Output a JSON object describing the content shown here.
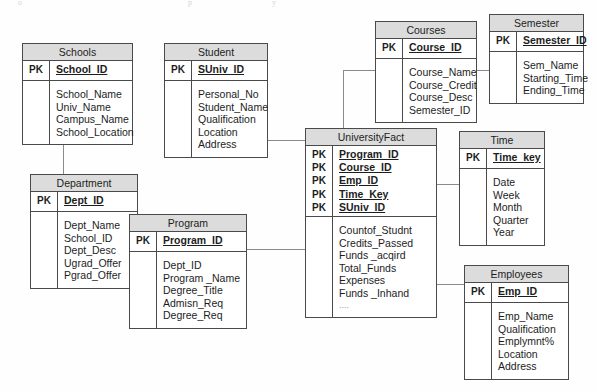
{
  "diagram": {
    "pk_label": "PK",
    "ellipsis": "....",
    "colors": {
      "header_fill": "#dcdcdc",
      "border": "#4a4a4a",
      "connector": "#8a8a8a",
      "text": "#1d1d1d",
      "background": "#fefefe"
    },
    "entities": [
      {
        "id": "schools",
        "name": "Schools",
        "keys": [
          "School_ID"
        ],
        "attributes": [
          "School_Name",
          "Univ_Name",
          "Campus_Name",
          "School_Location"
        ]
      },
      {
        "id": "student",
        "name": "Student",
        "keys": [
          "SUniv_ID"
        ],
        "attributes": [
          "Personal_No",
          "Student_Name",
          "Qualification",
          "Location",
          "Address"
        ]
      },
      {
        "id": "courses",
        "name": "Courses",
        "keys": [
          "Course_ID"
        ],
        "attributes": [
          "Course_Name",
          "Course_Credit",
          "Course_Desc",
          "Semester_ID"
        ]
      },
      {
        "id": "semester",
        "name": "Semester",
        "keys": [
          "Semester_ID"
        ],
        "attributes": [
          "Sem_Name",
          "Starting_Time",
          "Ending_Time"
        ]
      },
      {
        "id": "department",
        "name": "Department",
        "keys": [
          "Dept_ID"
        ],
        "attributes": [
          "Dept_Name",
          "School_ID",
          "Dept_Desc",
          "Ugrad_Offer",
          "Pgrad_Offer"
        ]
      },
      {
        "id": "program",
        "name": "Program",
        "keys": [
          "Program_ID"
        ],
        "attributes": [
          "Dept_ID",
          "Program _Name",
          "Degree_Title",
          "Admisn_Req",
          "Degree_Req"
        ]
      },
      {
        "id": "universityfact",
        "name": "UniversityFact",
        "keys": [
          "Program_ID",
          "Course_ID",
          "Emp_ID",
          "Time_Key",
          "SUniv_ID"
        ],
        "attributes": [
          "Countof_Studnt",
          "Credits_Passed",
          "Funds _acqird",
          "Total_Funds",
          "Expenses",
          "Funds _Inhand",
          "...."
        ]
      },
      {
        "id": "time",
        "name": "Time",
        "keys": [
          "Time_key"
        ],
        "attributes": [
          "Date",
          "Week",
          "Month",
          "Quarter",
          "Year"
        ]
      },
      {
        "id": "employees",
        "name": "Employees",
        "keys": [
          "Emp_ID"
        ],
        "attributes": [
          "Emp_Name",
          "Qualification",
          "Emplymnt%",
          "Location",
          "Address"
        ]
      }
    ],
    "relationships": [
      {
        "from": "schools",
        "to": "department"
      },
      {
        "from": "department",
        "to": "program"
      },
      {
        "from": "program",
        "to": "universityfact"
      },
      {
        "from": "student",
        "to": "universityfact"
      },
      {
        "from": "courses",
        "to": "universityfact"
      },
      {
        "from": "courses",
        "to": "semester"
      },
      {
        "from": "universityfact",
        "to": "time"
      },
      {
        "from": "universityfact",
        "to": "employees"
      }
    ]
  }
}
